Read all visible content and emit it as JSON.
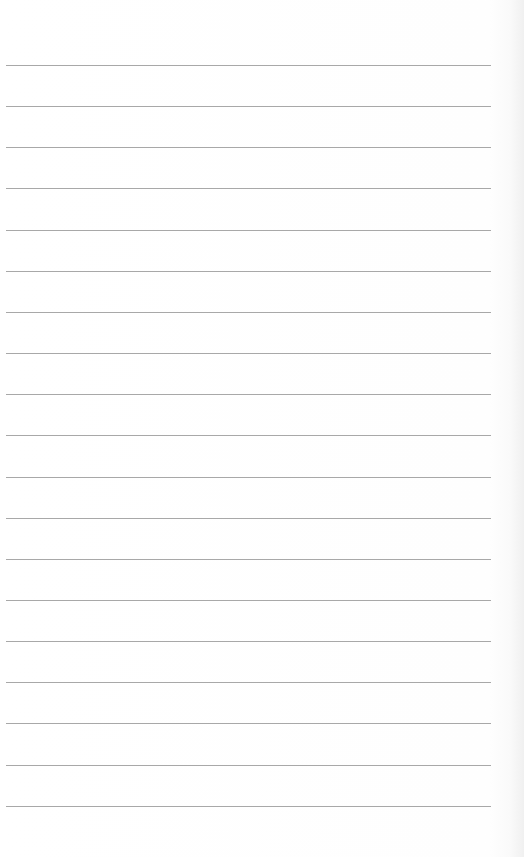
{
  "page": {
    "type": "lined-paper",
    "background_color": "#ffffff",
    "rule_color": "#a8a8a8",
    "rule_count": 19,
    "first_rule_y": 65,
    "rule_spacing": 41.15,
    "rule_left": 6,
    "rule_width": 485
  }
}
